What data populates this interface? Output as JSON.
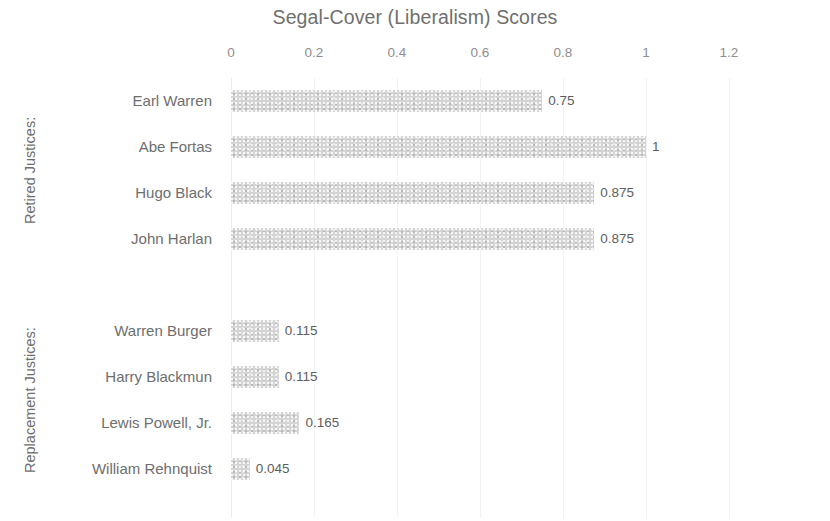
{
  "chart_data": {
    "type": "bar",
    "orientation": "horizontal",
    "title": "Segal-Cover (Liberalism) Scores",
    "xlabel": "",
    "ylabel": "",
    "xlim": [
      0,
      1.2
    ],
    "xticks": [
      "0",
      "0.2",
      "0.4",
      "0.6",
      "0.8",
      "1",
      "1.2"
    ],
    "xtick_values": [
      0,
      0.2,
      0.4,
      0.6,
      0.8,
      1,
      1.2
    ],
    "grid": "vertical",
    "legend": "none",
    "bar_color": "#d4d4d4",
    "title_color": "#6f6f6f",
    "label_color": "#6e6e6e",
    "categories": [
      "Earl Warren",
      "Abe Fortas",
      "Hugo Black",
      "John Harlan",
      "",
      "Warren Burger",
      "Harry Blackmun",
      "Lewis Powell, Jr.",
      "William Rehnquist"
    ],
    "values": [
      0.75,
      1,
      0.875,
      0.875,
      null,
      0.115,
      0.115,
      0.165,
      0.045
    ],
    "value_labels": [
      "0.75",
      "1",
      "0.875",
      "0.875",
      "",
      "0.115",
      "0.115",
      "0.165",
      "0.045"
    ],
    "groups": [
      {
        "label": "Retired Justices:",
        "categories": [
          "Earl Warren",
          "Abe Fortas",
          "Hugo Black",
          "John Harlan"
        ]
      },
      {
        "label": "Replacement Justices:",
        "categories": [
          "Warren Burger",
          "Harry Blackmun",
          "Lewis Powell, Jr.",
          "William Rehnquist"
        ]
      }
    ]
  },
  "groups": {
    "retired": "Retired Justices:",
    "replacement": "Replacement Justices:"
  },
  "rows": [
    {
      "label": "Earl Warren",
      "value_label": "0.75"
    },
    {
      "label": "Abe Fortas",
      "value_label": "1"
    },
    {
      "label": "Hugo Black",
      "value_label": "0.875"
    },
    {
      "label": "John Harlan",
      "value_label": "0.875"
    },
    {
      "label": "",
      "value_label": ""
    },
    {
      "label": "Warren Burger",
      "value_label": "0.115"
    },
    {
      "label": "Harry Blackmun",
      "value_label": "0.115"
    },
    {
      "label": "Lewis Powell, Jr.",
      "value_label": "0.165"
    },
    {
      "label": "William Rehnquist",
      "value_label": "0.045"
    }
  ],
  "axis": {
    "ticks": [
      "0",
      "0.2",
      "0.4",
      "0.6",
      "0.8",
      "1",
      "1.2"
    ]
  },
  "title": "Segal-Cover (Liberalism) Scores"
}
